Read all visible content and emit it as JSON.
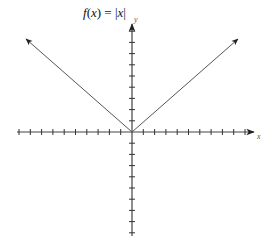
{
  "chart_data": {
    "type": "line",
    "title": "f(x) = |x|",
    "title_parts": {
      "f": "f",
      "open": "(",
      "var": "x",
      "close_eq": ") = |",
      "var2": "x",
      "end": "|"
    },
    "xlabel": "x",
    "ylabel": "y",
    "xlim": [
      -10,
      10.5
    ],
    "ylim": [
      -9.5,
      9.5
    ],
    "x_ticks": [
      -10,
      -9,
      -8,
      -7,
      -6,
      -5,
      -4,
      -3,
      -2,
      -1,
      1,
      2,
      3,
      4,
      5,
      6,
      7,
      8,
      9,
      10
    ],
    "y_ticks": [
      -9,
      -8,
      -7,
      -6,
      -5,
      -4,
      -3,
      -2,
      -1,
      1,
      2,
      3,
      4,
      5,
      6,
      7,
      8,
      9
    ],
    "tick_labels_shown": false,
    "grid": false,
    "series": [
      {
        "name": "f(x) = |x|",
        "x": [
          -9.5,
          0,
          9.5
        ],
        "y": [
          8.5,
          0,
          8.5
        ],
        "arrows_at_ends": true
      }
    ],
    "axes": {
      "x_arrow": "positive-end",
      "y_arrow": "positive-end"
    },
    "colors": {
      "axis": "#333333",
      "line": "#444444",
      "text": "#111111"
    }
  }
}
